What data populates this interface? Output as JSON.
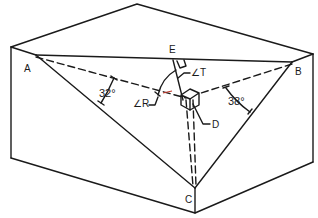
{
  "figure": {
    "type": "3D geometric diagram of box with inscribed triangle",
    "points": {
      "A": "A",
      "B": "B",
      "C": "C",
      "D": "D",
      "E": "E"
    },
    "angles": {
      "left": "32°",
      "right": "38°",
      "R": "∠R",
      "T": "∠T"
    },
    "colors": {
      "line": "#1a1a1a",
      "background": "#ffffff",
      "accent": "#c0392b"
    }
  }
}
